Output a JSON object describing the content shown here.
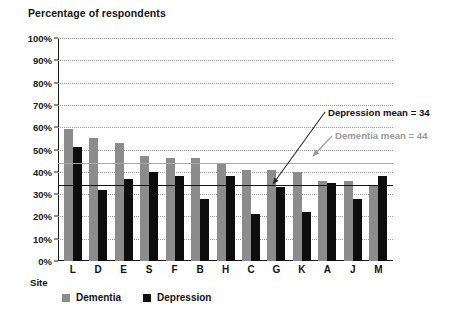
{
  "chart_data": {
    "type": "bar",
    "title": "Percentage of respondents",
    "xlabel": "Site",
    "ylabel": "",
    "ylim": [
      0,
      100
    ],
    "ytick_labels": [
      "100%",
      "90%",
      "80%",
      "70%",
      "60%",
      "50%",
      "40%",
      "30%",
      "20%",
      "10%",
      "0%"
    ],
    "ytick_values": [
      100,
      90,
      80,
      70,
      60,
      50,
      40,
      30,
      20,
      10,
      0
    ],
    "grid": true,
    "legend_position": "bottom-left",
    "categories": [
      "L",
      "D",
      "E",
      "S",
      "F",
      "B",
      "H",
      "C",
      "G",
      "K",
      "A",
      "J",
      "M"
    ],
    "series": [
      {
        "name": "Dementia",
        "color": "#8c8c8c",
        "values": [
          59,
          55,
          53,
          47,
          46,
          46,
          44,
          41,
          41,
          40,
          36,
          36,
          34
        ]
      },
      {
        "name": "Depression",
        "color": "#0d0d0d",
        "values": [
          51,
          32,
          37,
          40,
          38,
          28,
          38,
          21,
          33,
          22,
          35,
          28,
          38
        ]
      }
    ],
    "annotations": [
      {
        "key": "depression_mean",
        "text": "Depression mean = 34",
        "value": 34,
        "color": "#101010"
      },
      {
        "key": "dementia_mean",
        "text": "Dementia mean = 44",
        "value": 44,
        "color": "#9a9a9a"
      }
    ]
  }
}
